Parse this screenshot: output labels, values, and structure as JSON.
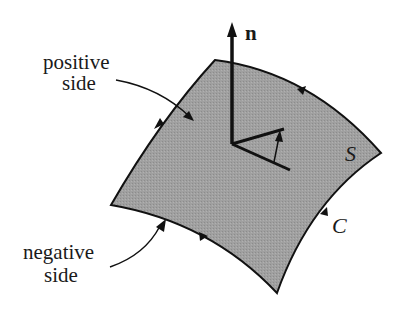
{
  "diagram": {
    "type": "oriented surface with boundary curve",
    "labels": {
      "positive_side_line1": "positive",
      "positive_side_line2": "side",
      "negative_side_line1": "negative",
      "negative_side_line2": "side",
      "normal": "n",
      "surface": "S",
      "curve": "C"
    },
    "colors": {
      "surface_fill": "#9a9a9a",
      "stroke": "#111111",
      "background": "#ffffff"
    },
    "elements": [
      {
        "name": "surface",
        "description": "curved quadrilateral patch shaded gray"
      },
      {
        "name": "boundary-curve",
        "description": "oriented boundary with direction arrows (counterclockwise viewed from n)"
      },
      {
        "name": "normal-vector",
        "description": "unit normal n pointing up from the surface"
      },
      {
        "name": "tangent-lines",
        "description": "two tangent segments at base of normal with a small rotation arrow between them"
      },
      {
        "name": "positive-side-pointer",
        "description": "curved arrow from 'positive side' label pointing into top surface"
      },
      {
        "name": "negative-side-pointer",
        "description": "curved arrow from 'negative side' label pointing to underside"
      }
    ]
  }
}
